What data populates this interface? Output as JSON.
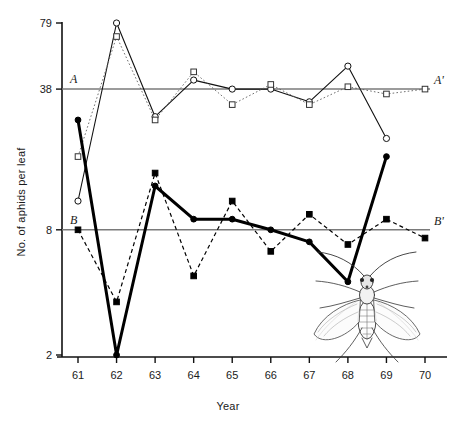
{
  "chart_data": {
    "type": "line",
    "title": "",
    "xlabel": "Year",
    "ylabel": "No. of aphids per leaf",
    "scale": "log",
    "categories": [
      "61",
      "62",
      "63",
      "64",
      "65",
      "66",
      "67",
      "68",
      "69",
      "70"
    ],
    "x_ticks": [
      "61",
      "62",
      "63",
      "64",
      "65",
      "66",
      "67",
      "68",
      "69",
      "70"
    ],
    "y_ticks": [
      "79",
      "38",
      "8",
      "2"
    ],
    "y_tick_values": [
      79,
      38,
      8,
      2
    ],
    "ylim": [
      2,
      79
    ],
    "grid": false,
    "legend_position": "none",
    "reference_lines": [
      {
        "label_left": "A",
        "label_right": "A'",
        "value": 38,
        "name": "mean-line-a"
      },
      {
        "label_left": "B",
        "label_right": "B'",
        "value": 8,
        "name": "mean-line-b"
      }
    ],
    "series": [
      {
        "name": "upper-open-circle",
        "marker": "open-circle",
        "line": "solid",
        "color": "#111111",
        "x": [
          "61",
          "62",
          "63",
          "64",
          "65",
          "66",
          "67",
          "68",
          "69"
        ],
        "values": [
          11,
          79,
          28,
          42,
          38,
          38,
          33,
          49,
          22
        ]
      },
      {
        "name": "upper-open-square",
        "marker": "open-square",
        "line": "dotted",
        "color": "#555555",
        "x": [
          "61",
          "62",
          "63",
          "64",
          "65",
          "66",
          "67",
          "68",
          "69",
          "70"
        ],
        "values": [
          18,
          68,
          27,
          46,
          32,
          40,
          32,
          39,
          36,
          38
        ]
      },
      {
        "name": "lower-filled-circle",
        "marker": "filled-circle",
        "line": "solid-thick",
        "color": "#000000",
        "x": [
          "61",
          "62",
          "63",
          "64",
          "65",
          "66",
          "67",
          "68",
          "69"
        ],
        "values": [
          27,
          2,
          13,
          9,
          9,
          8,
          7,
          4.5,
          18
        ]
      },
      {
        "name": "lower-filled-square",
        "marker": "filled-square",
        "line": "dashed",
        "color": "#000000",
        "x": [
          "61",
          "62",
          "63",
          "64",
          "65",
          "66",
          "67",
          "68",
          "69",
          "70"
        ],
        "values": [
          8,
          3.6,
          15,
          4.8,
          11,
          6.3,
          9.5,
          6.8,
          9,
          7.3
        ]
      }
    ],
    "annotations": [
      {
        "name": "aphid-illustration",
        "kind": "drawing",
        "description": "winged aphid"
      }
    ]
  }
}
